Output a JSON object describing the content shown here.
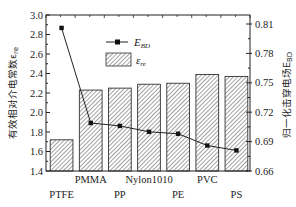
{
  "chart_data": {
    "type": "bar",
    "title": "",
    "categories": [
      "PTFE",
      "PMMA",
      "PP",
      "Nylon1010",
      "PE",
      "PVC",
      "PS"
    ],
    "series": [
      {
        "name": "ε_re",
        "kind": "bar",
        "axis": "left",
        "values": [
          1.72,
          2.23,
          2.25,
          2.29,
          2.3,
          2.39,
          2.37
        ]
      },
      {
        "name": "E_BD",
        "kind": "line",
        "axis": "right",
        "values": [
          0.806,
          0.709,
          0.706,
          0.7,
          0.698,
          0.686,
          0.681
        ]
      }
    ],
    "xlabel": "",
    "ylabel": "有效相对介电常数ε_re",
    "y2label": "归一化击穿电场E_BD",
    "ylim": [
      1.4,
      3.0
    ],
    "y2lim": [
      0.66,
      0.81
    ],
    "yticks": [
      "1.4",
      "1.6",
      "1.8",
      "2.0",
      "2.2",
      "2.4",
      "2.6",
      "2.8",
      "3.0"
    ],
    "y2ticks": [
      "0.66",
      "0.69",
      "0.72",
      "0.75",
      "0.78",
      "0.81"
    ],
    "legend": {
      "position": "upper-right-inside",
      "entries": [
        "E_BD",
        "ε_re"
      ]
    },
    "grid": false
  }
}
